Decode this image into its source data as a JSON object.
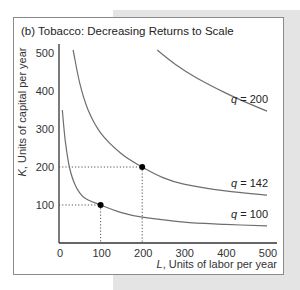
{
  "chart_data": {
    "type": "line",
    "title": "(b) Tobacco: Decreasing Returns to Scale",
    "xlabel": "L, Units of labor per year",
    "xlabel_var": "L",
    "xlabel_rest": ", Units of labor per year",
    "ylabel": "K, Units of capital per year",
    "ylabel_var": "K",
    "ylabel_rest": ", Units of capital per year",
    "xlim": [
      0,
      500
    ],
    "ylim": [
      0,
      500
    ],
    "xticks": [
      "0",
      "100",
      "200",
      "300",
      "400",
      "500"
    ],
    "yticks": [
      "100",
      "200",
      "300",
      "400",
      "500"
    ],
    "grid": false,
    "series": [
      {
        "name": "q = 100",
        "label_var": "q",
        "label_rest": " = 100",
        "points": [
          [
            8,
            350
          ],
          [
            15,
            270
          ],
          [
            25,
            200
          ],
          [
            40,
            150
          ],
          [
            60,
            120
          ],
          [
            100,
            100
          ],
          [
            150,
            80
          ],
          [
            200,
            68
          ],
          [
            300,
            55
          ],
          [
            400,
            49
          ],
          [
            500,
            45
          ]
        ]
      },
      {
        "name": "q = 142",
        "label_var": "q",
        "label_rest": " = 142",
        "points": [
          [
            34,
            508
          ],
          [
            50,
            420
          ],
          [
            70,
            350
          ],
          [
            100,
            290
          ],
          [
            150,
            235
          ],
          [
            200,
            200
          ],
          [
            250,
            172
          ],
          [
            300,
            155
          ],
          [
            400,
            137
          ],
          [
            500,
            126
          ]
        ]
      },
      {
        "name": "q = 200",
        "label_var": "q",
        "label_rest": " = 200",
        "points": [
          [
            236,
            508
          ],
          [
            280,
            470
          ],
          [
            330,
            435
          ],
          [
            400,
            395
          ],
          [
            450,
            370
          ],
          [
            500,
            347
          ]
        ]
      }
    ],
    "highlighted_points": [
      {
        "L": 100,
        "K": 100,
        "q": 100
      },
      {
        "L": 200,
        "K": 200,
        "q": 142
      }
    ],
    "colors": {
      "curve": "#6e6e6e",
      "axis": "#333333",
      "point": "#000000",
      "guide": "#555555"
    }
  }
}
